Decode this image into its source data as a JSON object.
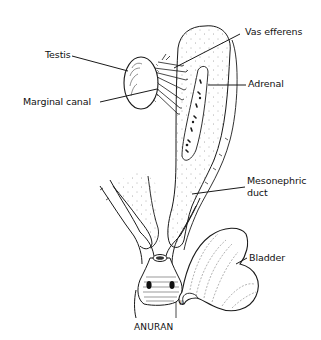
{
  "diagram": {
    "caption": "ANURAN",
    "signature": "JL",
    "stroke_color": "#1a1a1a",
    "labels": [
      {
        "id": "testis",
        "text": "Testis"
      },
      {
        "id": "marginal-canal",
        "text": "Marginal canal"
      },
      {
        "id": "vas-efferens",
        "text": "Vas efferens"
      },
      {
        "id": "adrenal",
        "text": "Adrenal"
      },
      {
        "id": "mesonephric-duct-line1",
        "text": "Mesonephric"
      },
      {
        "id": "mesonephric-duct-line2",
        "text": "duct"
      },
      {
        "id": "bladder",
        "text": "Bladder"
      }
    ]
  }
}
